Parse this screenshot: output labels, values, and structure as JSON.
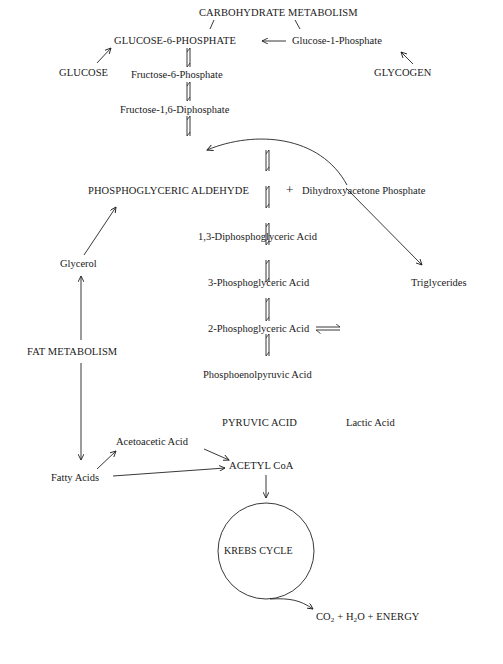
{
  "diagram": {
    "title": "CARBOHYDRATE METABOLISM",
    "nodes": {
      "carb_metabolism": "CARBOHYDRATE METABOLISM",
      "glucose6p": "GLUCOSE-6-PHOSPHATE",
      "glucose1p": "Glucose-1-Phosphate",
      "glucose": "GLUCOSE",
      "glycogen": "GLYCOGEN",
      "fructose6p": "Fructose-6-Phosphate",
      "fructose16dp": "Fructose-1,6-Diphosphate",
      "pga_aldehyde": "PHOSPHOGLYCERIC ALDEHYDE",
      "plus1": "+",
      "dhap": "Dihydroxyacetone Phosphate",
      "dpga13": "1,3-Diphosphoglyceric Acid",
      "pga3": "3-Phosphoglyceric Acid",
      "pga2": "2-Phosphoglyceric Acid",
      "pep": "Phosphoenolpyruvic Acid",
      "pyruvic": "PYRUVIC ACID",
      "lactic": "Lactic Acid",
      "glycerol": "Glycerol",
      "triglycerides": "Triglycerides",
      "fat_metabolism": "FAT METABOLISM",
      "acetoacetic": "Acetoacetic Acid",
      "fatty_acids": "Fatty Acids",
      "acetyl_coa": "ACETYL CoA",
      "krebs": "KREBS CYCLE",
      "products_co": "CO",
      "products_sub1": "2",
      "products_mid": " + H",
      "products_sub2": "2",
      "products_end": "O + ENERGY"
    },
    "edges": [
      {
        "from": "carb_metabolism",
        "to": "glucose6p",
        "type": "line"
      },
      {
        "from": "carb_metabolism",
        "to": "glucose1p",
        "type": "line"
      },
      {
        "from": "glucose1p",
        "to": "glucose6p",
        "type": "arrow"
      },
      {
        "from": "glucose",
        "to": "glucose6p",
        "type": "arrow"
      },
      {
        "from": "glycogen",
        "to": "glucose1p",
        "type": "arrow"
      },
      {
        "from": "glucose6p",
        "to": "fructose6p",
        "type": "reversible"
      },
      {
        "from": "fructose6p",
        "to": "fructose16dp",
        "type": "reversible"
      },
      {
        "from": "fructose16dp",
        "to": "pga_aldehyde",
        "type": "reversible"
      },
      {
        "from": "dhap",
        "to": "pga_aldehyde",
        "type": "curved-arrow"
      },
      {
        "from": "dhap",
        "to": "triglycerides",
        "type": "arrow"
      },
      {
        "from": "pga_aldehyde",
        "to": "dpga13",
        "type": "reversible"
      },
      {
        "from": "dpga13",
        "to": "pga3",
        "type": "reversible"
      },
      {
        "from": "pga3",
        "to": "pga2",
        "type": "reversible"
      },
      {
        "from": "pga2",
        "to": "pep",
        "type": "reversible"
      },
      {
        "from": "pep",
        "to": "pyruvic",
        "type": "reversible"
      },
      {
        "from": "pyruvic",
        "to": "lactic",
        "type": "reversible"
      },
      {
        "from": "pyruvic",
        "to": "acetyl_coa",
        "type": "reversible"
      },
      {
        "from": "glycerol",
        "to": "pga_aldehyde",
        "type": "arrow"
      },
      {
        "from": "fat_metabolism",
        "to": "glycerol",
        "type": "arrow"
      },
      {
        "from": "fat_metabolism",
        "to": "fatty_acids",
        "type": "arrow"
      },
      {
        "from": "fatty_acids",
        "to": "acetoacetic",
        "type": "arrow"
      },
      {
        "from": "fatty_acids",
        "to": "acetyl_coa",
        "type": "arrow"
      },
      {
        "from": "acetoacetic",
        "to": "acetyl_coa",
        "type": "arrow"
      },
      {
        "from": "acetyl_coa",
        "to": "krebs",
        "type": "arrow"
      },
      {
        "from": "krebs",
        "to": "products",
        "type": "curved-arrow"
      }
    ]
  }
}
